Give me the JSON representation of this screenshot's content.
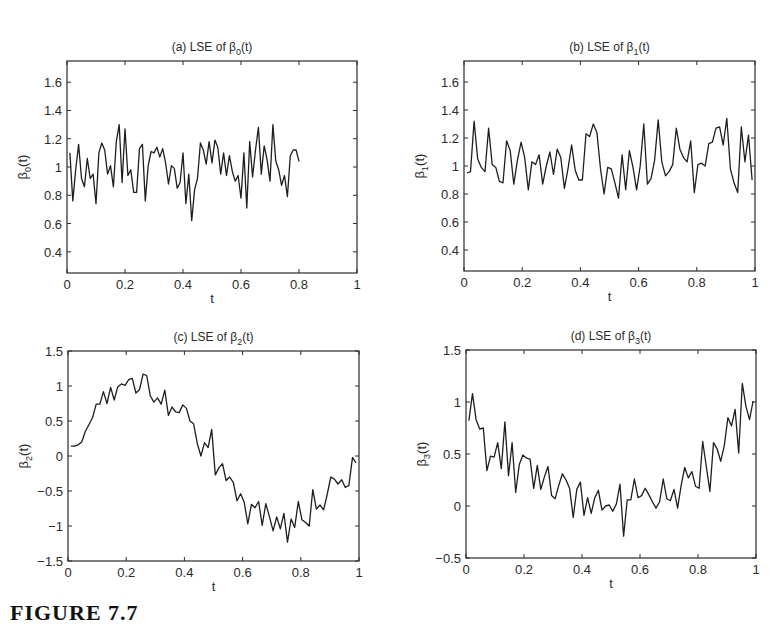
{
  "caption": "FIGURE 7.7",
  "chart_data": [
    {
      "id": "a",
      "type": "line",
      "title": "(a) LSE of β0(t)",
      "title_parts": {
        "prefix": "(a) LSE of β",
        "sub": "0",
        "suffix": "(t)"
      },
      "xlabel": "t",
      "ylabel": {
        "base": "β",
        "sub": "0",
        "suffix": "(t)"
      },
      "xlim": [
        0,
        1
      ],
      "ylim": [
        0.25,
        1.75
      ],
      "xticks": [
        0,
        0.2,
        0.4,
        0.6,
        0.8,
        1
      ],
      "xtick_labels": [
        "0",
        "0.2",
        "0.4",
        "0.6",
        "0.8",
        "1"
      ],
      "yticks": [
        0.4,
        0.6,
        0.8,
        1,
        1.2,
        1.4,
        1.6
      ],
      "ytick_labels": [
        "0.4",
        "0.6",
        "0.8",
        "1",
        "1.2",
        "1.4",
        "1.6"
      ],
      "grid": false,
      "box": {
        "x": 67,
        "y": 61,
        "w": 290,
        "h": 212
      },
      "x": [
        0.01,
        0.02,
        0.03,
        0.04,
        0.05,
        0.06,
        0.07,
        0.08,
        0.09,
        0.1,
        0.11,
        0.12,
        0.13,
        0.14,
        0.15,
        0.16,
        0.17,
        0.18,
        0.19,
        0.2,
        0.21,
        0.22,
        0.23,
        0.24,
        0.25,
        0.26,
        0.27,
        0.28,
        0.29,
        0.3,
        0.31,
        0.32,
        0.33,
        0.34,
        0.35,
        0.36,
        0.37,
        0.38,
        0.39,
        0.4,
        0.41,
        0.42,
        0.43,
        0.44,
        0.45,
        0.46,
        0.47,
        0.48,
        0.49,
        0.5,
        0.51,
        0.52,
        0.53,
        0.54,
        0.55,
        0.56,
        0.57,
        0.58,
        0.59,
        0.6,
        0.61,
        0.62,
        0.63,
        0.64,
        0.65,
        0.66,
        0.67,
        0.68,
        0.69,
        0.7,
        0.71,
        0.72,
        0.73,
        0.74,
        0.75,
        0.76,
        0.77,
        0.78,
        0.79,
        0.8,
        0.81,
        0.82,
        0.83,
        0.84,
        0.85,
        0.86,
        0.87,
        0.88,
        0.89,
        0.9,
        0.91,
        0.92,
        0.93,
        0.94,
        0.95,
        0.96,
        0.97,
        0.98,
        0.99
      ],
      "values": [
        1.1,
        0.76,
        0.98,
        1.16,
        0.92,
        0.86,
        1.06,
        0.92,
        0.95,
        0.74,
        1.1,
        1.17,
        1.12,
        0.95,
        1.01,
        0.86,
        1.18,
        1.3,
        0.89,
        1.27,
        0.94,
        0.98,
        0.82,
        0.82,
        1.13,
        1.16,
        0.76,
        1.01,
        1.11,
        1.1,
        1.14,
        1.07,
        1.13,
        1.03,
        0.88,
        1.01,
        0.99,
        0.85,
        0.89,
        1.1,
        0.74,
        0.95,
        0.62,
        0.84,
        0.92,
        1.17,
        1.12,
        1.02,
        1.18,
        1.03,
        1.19,
        1.14,
        0.95,
        1.1,
        0.94,
        1.08,
        0.97,
        0.9,
        0.94,
        0.78,
        1.1,
        0.71,
        1.18,
        0.93,
        1.12,
        1.28,
        0.95,
        1.15,
        1.05,
        0.9,
        1.3,
        1.04,
        0.98,
        0.87,
        0.94,
        0.79,
        1.08,
        1.12,
        1.12,
        1.04
      ]
    },
    {
      "id": "b",
      "type": "line",
      "title": "(b) LSE of β1(t)",
      "title_parts": {
        "prefix": "(b) LSE of β",
        "sub": "1",
        "suffix": "(t)"
      },
      "xlabel": "t",
      "ylabel": {
        "base": "β",
        "sub": "1",
        "suffix": "(t)"
      },
      "xlim": [
        0,
        1
      ],
      "ylim": [
        0.25,
        1.75
      ],
      "xticks": [
        0,
        0.2,
        0.4,
        0.6,
        0.8,
        1
      ],
      "xtick_labels": [
        "0",
        "0.2",
        "0.4",
        "0.6",
        "0.8",
        "1"
      ],
      "yticks": [
        0.4,
        0.6,
        0.8,
        1,
        1.2,
        1.4,
        1.6
      ],
      "ytick_labels": [
        "0.4",
        "0.6",
        "0.8",
        "1",
        "1.2",
        "1.4",
        "1.6"
      ],
      "grid": false,
      "box": {
        "x": 464,
        "y": 61,
        "w": 291,
        "h": 210
      },
      "values": [
        0.95,
        0.96,
        1.32,
        1.05,
        0.99,
        0.96,
        1.27,
        1.01,
        0.99,
        0.89,
        0.88,
        1.18,
        1.11,
        0.87,
        1.04,
        1.17,
        1.06,
        0.83,
        1.03,
        1.01,
        1.08,
        0.87,
        1.0,
        1.1,
        0.94,
        1.12,
        1.06,
        0.84,
        0.98,
        1.15,
        0.97,
        0.9,
        0.9,
        1.23,
        1.21,
        1.3,
        1.24,
        0.98,
        0.8,
        0.99,
        0.98,
        0.88,
        0.77,
        1.08,
        0.83,
        1.11,
        0.99,
        0.83,
        1.0,
        1.3,
        0.87,
        0.91,
        1.04,
        1.33,
        1.03,
        0.93,
        0.96,
        1.01,
        1.27,
        1.12,
        1.06,
        1.03,
        1.18,
        0.81,
        1.01,
        1.02,
        1.0,
        1.16,
        1.17,
        1.27,
        1.28,
        1.15,
        1.34,
        0.98,
        0.88,
        0.81,
        1.28,
        1.03,
        1.22,
        0.9
      ]
    },
    {
      "id": "c",
      "type": "line",
      "title": "(c) LSE of β2(t)",
      "title_parts": {
        "prefix": "(c) LSE of β",
        "sub": "2",
        "suffix": "(t)"
      },
      "xlabel": "t",
      "ylabel": {
        "base": "β",
        "sub": "2",
        "suffix": "(t)"
      },
      "xlim": [
        0,
        1
      ],
      "ylim": [
        -1.5,
        1.5
      ],
      "xticks": [
        0,
        0.2,
        0.4,
        0.6,
        0.8,
        1
      ],
      "xtick_labels": [
        "0",
        "0.2",
        "0.4",
        "0.6",
        "0.8",
        "1"
      ],
      "yticks": [
        -1.5,
        -1,
        -0.5,
        0,
        0.5,
        1,
        1.5
      ],
      "ytick_labels": [
        "−1.5",
        "−1",
        "−0.5",
        "0",
        "0.5",
        "1",
        "1.5"
      ],
      "grid": false,
      "box": {
        "x": 68,
        "y": 351,
        "w": 291,
        "h": 210
      },
      "values": [
        0.14,
        0.14,
        0.16,
        0.2,
        0.35,
        0.45,
        0.55,
        0.74,
        0.74,
        0.92,
        0.75,
        0.98,
        0.8,
        0.99,
        1.03,
        1.01,
        1.09,
        1.11,
        0.9,
        0.95,
        1.17,
        1.15,
        0.86,
        0.77,
        0.83,
        0.74,
        0.94,
        0.58,
        0.7,
        0.63,
        0.62,
        0.73,
        0.68,
        0.5,
        0.46,
        0.18,
        0.0,
        0.19,
        0.12,
        0.38,
        -0.27,
        -0.17,
        -0.11,
        -0.35,
        -0.3,
        -0.38,
        -0.64,
        -0.54,
        -0.66,
        -0.97,
        -0.69,
        -0.74,
        -0.65,
        -0.99,
        -0.68,
        -0.87,
        -1.07,
        -0.87,
        -1.04,
        -0.82,
        -1.23,
        -0.9,
        -1.02,
        -0.65,
        -0.91,
        -0.95,
        -1.0,
        -0.48,
        -0.76,
        -0.7,
        -0.77,
        -0.55,
        -0.3,
        -0.33,
        -0.4,
        -0.34,
        -0.45,
        -0.42,
        -0.02,
        -0.1
      ]
    },
    {
      "id": "d",
      "type": "line",
      "title": "(d) LSE of β3(t)",
      "title_parts": {
        "prefix": "(d) LSE of β",
        "sub": "3",
        "suffix": "(t)"
      },
      "xlabel": "t",
      "ylabel": {
        "base": "β",
        "sub": "3",
        "suffix": "(t)"
      },
      "xlim": [
        0,
        1
      ],
      "ylim": [
        -0.5,
        1.5
      ],
      "xticks": [
        0,
        0.2,
        0.4,
        0.6,
        0.8,
        1
      ],
      "xtick_labels": [
        "0",
        "0.2",
        "0.4",
        "0.6",
        "0.8",
        "1"
      ],
      "yticks": [
        -0.5,
        0,
        0.5,
        1,
        1.5
      ],
      "ytick_labels": [
        "−0.5",
        "0",
        "0.5",
        "1",
        "1.5"
      ],
      "grid": false,
      "box": {
        "x": 466,
        "y": 350,
        "w": 290,
        "h": 208
      },
      "values": [
        0.82,
        1.08,
        0.83,
        0.74,
        0.75,
        0.34,
        0.48,
        0.47,
        0.61,
        0.36,
        0.81,
        0.29,
        0.61,
        0.13,
        0.4,
        0.49,
        0.46,
        0.45,
        0.17,
        0.39,
        0.16,
        0.28,
        0.38,
        0.1,
        0.07,
        0.2,
        0.31,
        0.25,
        0.17,
        -0.11,
        0.16,
        0.23,
        -0.09,
        0.08,
        -0.07,
        0.08,
        0.15,
        -0.04,
        0.0,
        0.01,
        -0.05,
        0.02,
        0.21,
        -0.29,
        0.06,
        0.06,
        0.26,
        0.08,
        0.1,
        0.17,
        0.11,
        0.04,
        -0.02,
        0.04,
        0.26,
        0.07,
        0.05,
        0.16,
        -0.02,
        0.2,
        0.37,
        0.27,
        0.33,
        0.19,
        0.17,
        0.62,
        0.38,
        0.14,
        0.61,
        0.55,
        0.43,
        0.58,
        0.85,
        0.77,
        0.93,
        0.51,
        1.18,
        0.96,
        0.83,
        1.01
      ]
    }
  ]
}
